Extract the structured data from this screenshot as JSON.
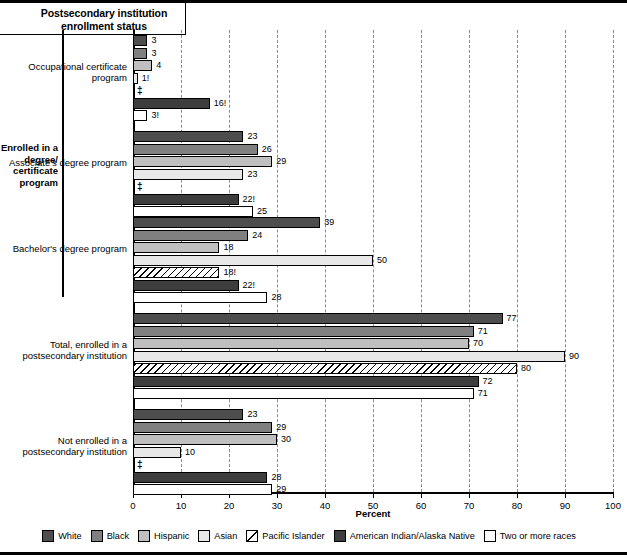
{
  "title": "Postsecondary institution enrollment status",
  "bracket_label": "Enrolled in a degree/ certificate program",
  "x_axis_label": "Percent",
  "suppressed_symbol": "‡",
  "axis": {
    "min": 0,
    "max": 100,
    "step": 10,
    "ticks": [
      "0",
      "10",
      "20",
      "30",
      "40",
      "50",
      "60",
      "70",
      "80",
      "90",
      "100"
    ]
  },
  "colors": {
    "white_series": "#4d4d4d",
    "black_series": "#808080",
    "hispanic_series": "#bfbfbf",
    "asian_series": "#e8e8e8",
    "pacific_islander_series": "#ffffff",
    "amerindian_series": "#3d3d3d",
    "two_or_more_series": "#ffffff",
    "gridline": "#8a8a8a",
    "axis": "#000000"
  },
  "legend": {
    "items": [
      {
        "label": "White",
        "swatch": "dark-gray-swatch"
      },
      {
        "label": "Black",
        "swatch": "medium-gray-swatch"
      },
      {
        "label": "Hispanic",
        "swatch": "light-gray-swatch"
      },
      {
        "label": "Asian",
        "swatch": "very-light-gray-swatch"
      },
      {
        "label": "Pacific Islander",
        "swatch": "diagonal-hatch-swatch"
      },
      {
        "label": "American Indian/Alaska Native",
        "swatch": "darkest-gray-swatch"
      },
      {
        "label": "Two or more races",
        "swatch": "white-swatch"
      }
    ]
  },
  "chart_data": {
    "type": "bar",
    "orientation": "horizontal",
    "title": "Postsecondary institution enrollment status",
    "xlabel": "Percent",
    "ylabel": "",
    "xlim": [
      0,
      100
    ],
    "grid": true,
    "legend_position": "bottom",
    "categories": [
      "Occupational certificate program",
      "Associate's degree program",
      "Bachelor's degree program",
      "Total, enrolled in a postsecondary institution",
      "Not enrolled in a postsecondary institution"
    ],
    "series": [
      {
        "name": "White",
        "values": [
          3,
          23,
          39,
          77,
          23
        ],
        "labels": [
          "3",
          "23",
          "39",
          "77",
          "23"
        ]
      },
      {
        "name": "Black",
        "values": [
          3,
          26,
          24,
          71,
          29
        ],
        "labels": [
          "3",
          "26",
          "24",
          "71",
          "29"
        ]
      },
      {
        "name": "Hispanic",
        "values": [
          4,
          29,
          18,
          70,
          30
        ],
        "labels": [
          "4",
          "29",
          "18",
          "70",
          "30"
        ]
      },
      {
        "name": "Asian",
        "values": [
          1,
          23,
          50,
          90,
          10
        ],
        "labels": [
          "1!",
          "23",
          "50",
          "90",
          "10"
        ]
      },
      {
        "name": "Pacific Islander",
        "values": [
          null,
          null,
          18,
          80,
          null
        ],
        "labels": [
          "‡",
          "‡",
          "18!",
          "80",
          "‡"
        ]
      },
      {
        "name": "American Indian/Alaska Native",
        "values": [
          16,
          22,
          22,
          72,
          28
        ],
        "labels": [
          "16!",
          "22!",
          "22!",
          "72",
          "28"
        ]
      },
      {
        "name": "Two or more races",
        "values": [
          3,
          25,
          28,
          71,
          29
        ],
        "labels": [
          "3!",
          "25",
          "28",
          "71",
          "29"
        ]
      }
    ],
    "notes": {
      "exclamation": "! Interpret data with caution.",
      "double_dagger": "‡ Reporting standards not met."
    }
  },
  "group_labels": [
    "Occupational certificate program",
    "Associate's degree program",
    "Bachelor's degree program",
    "Total, enrolled in a postsecondary institution",
    "Not enrolled in a postsecondary institution"
  ]
}
